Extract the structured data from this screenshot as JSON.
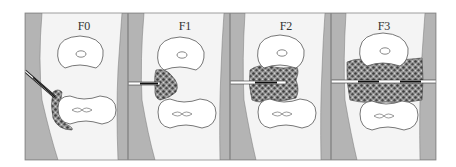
{
  "figure": {
    "type": "schematic-diagram",
    "panels": [
      {
        "id": "F0",
        "label": "F0",
        "fusion_extent": "small lateral bone tuft at lower vertebra, needle angled",
        "needle": "angled"
      },
      {
        "id": "F1",
        "label": "F1",
        "fusion_extent": "partial lateral bridge on left side",
        "needle": "horizontal-short"
      },
      {
        "id": "F2",
        "label": "F2",
        "fusion_extent": "bridge across most of disc space",
        "needle": "horizontal-long"
      },
      {
        "id": "F3",
        "label": "F3",
        "fusion_extent": "complete bridging across full disc space",
        "needle": "horizontal-full"
      }
    ]
  },
  "colors": {
    "background": "#ffffff",
    "frame": "#888888",
    "soft_tissue": "#f4f4f4",
    "cortex_band": "#b4b4b4",
    "vertebra_fill": "#ffffff",
    "outline": "#555555",
    "bone_graft": "#8a8a8a",
    "bone_graft_dark": "#3a3a3a",
    "needle_shaft": "#ffffff",
    "needle_core": "#111111"
  }
}
